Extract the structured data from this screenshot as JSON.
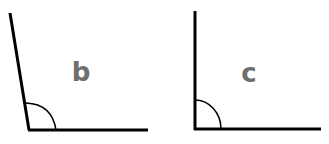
{
  "diagram": {
    "angles": [
      {
        "label": "b",
        "type": "obtuse",
        "approx_degrees": 99,
        "label_color": "#6e6e6e"
      },
      {
        "label": "c",
        "type": "right",
        "approx_degrees": 90,
        "label_color": "#6e6e6e"
      }
    ],
    "line_color": "#000000",
    "background": "#ffffff"
  }
}
